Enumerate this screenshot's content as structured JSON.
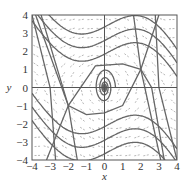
{
  "chart_data": {
    "type": "line",
    "subtype": "phase-portrait-direction-field",
    "title": "",
    "xlabel": "x",
    "ylabel": "y",
    "xlim": [
      -4,
      4
    ],
    "ylim": [
      -4,
      4
    ],
    "xticks": [
      "-4",
      "-3",
      "-2",
      "-1",
      "0",
      "1",
      "2",
      "3",
      "4"
    ],
    "yticks": [
      "4",
      "3",
      "2",
      "1",
      "0",
      "-1",
      "-2",
      "-3",
      "-4"
    ],
    "grid": false,
    "critical_points": [
      {
        "x": 0,
        "y": 0,
        "type": "spiral"
      },
      {
        "x": 2,
        "y": 1,
        "type": "saddle"
      },
      {
        "x": -2,
        "y": -1,
        "type": "saddle"
      }
    ],
    "colors": {
      "trajectory": "#666666",
      "field": "#888888",
      "axis": "#555555"
    }
  }
}
